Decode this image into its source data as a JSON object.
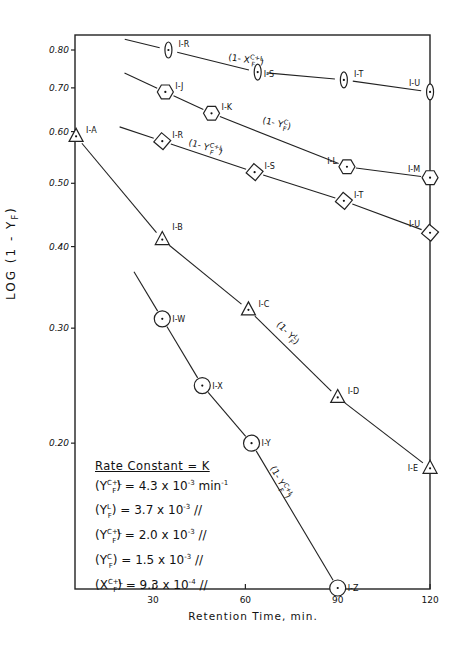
{
  "chart_data": {
    "type": "line",
    "title": "",
    "xlabel": "Retention Time, min.",
    "ylabel": "LOG (1 - Y_F)",
    "yscale": "log",
    "xlim": [
      4.6,
      120
    ],
    "ylim": [
      0.12,
      0.84
    ],
    "grid": false,
    "x_ticks": [
      30,
      60,
      90,
      120
    ],
    "y_ticks": [
      0.8,
      0.7,
      0.6,
      0.5,
      0.4,
      0.3,
      0.2
    ],
    "y_tick_labels": [
      "0.80",
      "0.70",
      "0.60",
      "0.50",
      "0.40",
      "0.30",
      "0.20"
    ],
    "series": [
      {
        "name": "(1 - X_F^{C+L})",
        "marker": "oval",
        "points": [
          {
            "label": "I-R",
            "x": 35,
            "y": 0.8
          },
          {
            "label": "I-S",
            "x": 64,
            "y": 0.74
          },
          {
            "label": "I-T",
            "x": 92,
            "y": 0.72
          },
          {
            "label": "I-U",
            "x": 120,
            "y": 0.69
          }
        ]
      },
      {
        "name": "(1 - Y_F^C)",
        "marker": "hexagon",
        "points": [
          {
            "label": "I-J",
            "x": 34,
            "y": 0.69
          },
          {
            "label": "I-K",
            "x": 49,
            "y": 0.64
          },
          {
            "label": "I-L",
            "x": 93,
            "y": 0.53
          },
          {
            "label": "I-M",
            "x": 120,
            "y": 0.51
          }
        ]
      },
      {
        "name": "(1 - Y_F^{C+L})",
        "marker": "diamond",
        "points": [
          {
            "label": "I-R",
            "x": 33,
            "y": 0.58
          },
          {
            "label": "I-S",
            "x": 63,
            "y": 0.52
          },
          {
            "label": "I-T",
            "x": 92,
            "y": 0.47
          },
          {
            "label": "I-U",
            "x": 120,
            "y": 0.42
          }
        ]
      },
      {
        "name": "(1 - Y_F^L)",
        "marker": "triangle",
        "points": [
          {
            "label": "I-A",
            "x": 5,
            "y": 0.59
          },
          {
            "label": "I-B",
            "x": 33,
            "y": 0.41
          },
          {
            "label": "I-C",
            "x": 61,
            "y": 0.32
          },
          {
            "label": "I-D",
            "x": 90,
            "y": 0.235
          },
          {
            "label": "I-E",
            "x": 120,
            "y": 0.183
          }
        ]
      },
      {
        "name": "(1 - Y_F^{C+L})",
        "marker": "circle",
        "points": [
          {
            "label": "I-W",
            "x": 33,
            "y": 0.31
          },
          {
            "label": "I-X",
            "x": 46,
            "y": 0.245
          },
          {
            "label": "I-Y",
            "x": 62,
            "y": 0.2
          },
          {
            "label": "I-Z",
            "x": 90,
            "y": 0.12
          }
        ]
      }
    ],
    "annotations": {
      "legend_title": "Rate Constant = K",
      "rate_constants": [
        {
          "symbol": "(Y_F^{C+L})",
          "value": "4.3 x 10^-3 min^-1"
        },
        {
          "symbol": "(Y_F^L)",
          "value": "3.7 x 10^-3 //"
        },
        {
          "symbol": "(Y_F^{C+L})",
          "value": "2.0 x 10^-3 //"
        },
        {
          "symbol": "(Y_F^C)",
          "value": "1.5 x 10^-3 //"
        },
        {
          "symbol": "(X_F^{C+L})",
          "value": "9.3 x 10^-4 //"
        }
      ]
    }
  },
  "axis": {
    "y_title": "LOG  (1 - Y",
    "y_title_sub": "F",
    "y_title_end": ")",
    "x_title": "Retention Time, min."
  },
  "curve_labels": {
    "x_cl": "(1- X",
    "y_c": "(1- Y",
    "y_cl": "(1- Y",
    "y_l": "(1- Y",
    "y_cl2": "(1- Y"
  },
  "legend": {
    "title": "Rate Constant = K",
    "rows": [
      {
        "sym": "Y",
        "sup": "C+L",
        "sub": "F",
        "val": " = 4.3 x 10",
        "exp": "-3",
        "unit": " min",
        "unit_exp": "-1"
      },
      {
        "sym": "Y",
        "sup": "L",
        "sub": "F",
        "val": " = 3.7 x 10",
        "exp": "-3",
        "unit": "  //",
        "unit_exp": ""
      },
      {
        "sym": "Y",
        "sup": "C+L",
        "sub": "F",
        "val": " = 2.0 x 10",
        "exp": "-3",
        "unit": "  //",
        "unit_exp": ""
      },
      {
        "sym": "Y",
        "sup": "C",
        "sub": "F",
        "val": " = 1.5 x 10",
        "exp": "-3",
        "unit": " //",
        "unit_exp": ""
      },
      {
        "sym": "X",
        "sup": "C+L",
        "sub": "F",
        "val": " = 9.3 x 10",
        "exp": "-4",
        "unit": " //",
        "unit_exp": ""
      }
    ]
  }
}
